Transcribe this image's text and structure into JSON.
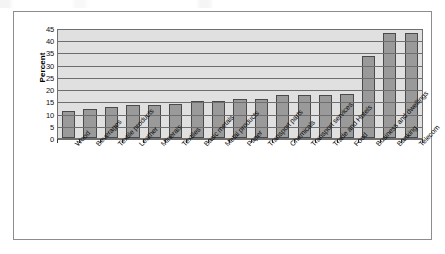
{
  "figure": {
    "y_axis_title": "Percent"
  },
  "chart_data": {
    "type": "bar",
    "title": "",
    "xlabel": "",
    "ylabel": "Percent",
    "ylim": [
      0,
      45
    ],
    "yticks": [
      0,
      5,
      10,
      15,
      20,
      25,
      30,
      35,
      40,
      45
    ],
    "ytick_labels": [
      "0",
      "5",
      "10",
      "15",
      "20",
      "25",
      "30",
      "35",
      "40",
      "45"
    ],
    "grid": true,
    "legend": "none",
    "bar_color": "#9a9a9a",
    "bar_edge_color": "#4a4a4a",
    "plot_background": "#e0e0e0",
    "categories": [
      "Wood",
      "Beverages",
      "Textile products",
      "Leather",
      "Minerals",
      "Textiles",
      "Basic metals",
      "Metal products",
      "Paper",
      "Transport parts",
      "Chemicals",
      "Transport services",
      "Trade and Hotels",
      "Food",
      "Business and dwellings",
      "Banking",
      "Telecom"
    ],
    "values": [
      11,
      12,
      12.5,
      13.5,
      13.7,
      13.8,
      15.2,
      15.2,
      16,
      16,
      17.6,
      17.7,
      17.7,
      18,
      33.5,
      43,
      43
    ]
  }
}
